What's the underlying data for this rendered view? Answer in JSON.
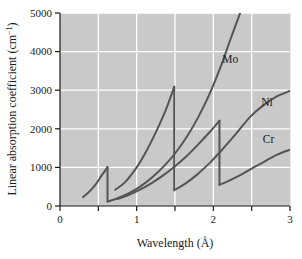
{
  "chart_data": {
    "type": "line",
    "title": "",
    "xlabel": "Wavelength (Å)",
    "ylabel": "Linear absorption coefficient (cm⁻¹)",
    "ylabel_main": "Linear absorption coefficient (cm",
    "ylabel_sup": "−1",
    "ylabel_tail": ")",
    "xlabel_main": "Wavelength (",
    "xlabel_unit": "Å",
    "xlabel_tail": ")",
    "xlim": [
      0,
      3
    ],
    "ylim": [
      0,
      5000
    ],
    "xticks": [
      0,
      1,
      2,
      3
    ],
    "xtick_labels": [
      "0",
      "1",
      "2",
      "3"
    ],
    "xminor_gridlines": [
      0.5,
      1.5,
      2.5
    ],
    "yticks": [
      0,
      1000,
      2000,
      3000,
      4000,
      5000
    ],
    "ytick_labels": [
      "0",
      "1000",
      "2000",
      "3000",
      "4000",
      "5000"
    ],
    "grid": true,
    "grid_color": "#ffffff",
    "plot_bg_color": "#c9c9c9",
    "line_color": "#555555",
    "legend_position": "inline-annotations",
    "series": [
      {
        "name": "Mo",
        "label": "Mo",
        "absorption_edge": 0.62,
        "segments": [
          {
            "x": [
              0.3,
              0.36,
              0.42,
              0.48,
              0.54,
              0.58,
              0.62
            ],
            "y": [
              230,
              330,
              450,
              600,
              780,
              890,
              1010
            ]
          },
          {
            "x": [
              0.62,
              0.75,
              0.9,
              1.05,
              1.2,
              1.35,
              1.5,
              1.65,
              1.8,
              1.95,
              2.1,
              2.22,
              2.35
            ],
            "y": [
              115,
              200,
              330,
              510,
              740,
              1020,
              1360,
              1780,
              2290,
              2900,
              3630,
              4300,
              5000
            ]
          }
        ]
      },
      {
        "name": "Ni",
        "label": "Ni",
        "absorption_edge": 1.49,
        "segments": [
          {
            "x": [
              0.72,
              0.85,
              1.0,
              1.12,
              1.24,
              1.34,
              1.42,
              1.49
            ],
            "y": [
              420,
              620,
              1000,
              1400,
              1870,
              2300,
              2700,
              3090
            ]
          },
          {
            "x": [
              1.49,
              1.62,
              1.78,
              1.95,
              2.12,
              2.3,
              2.48,
              2.66,
              2.84,
              3.0
            ],
            "y": [
              410,
              560,
              800,
              1110,
              1470,
              1880,
              2310,
              2620,
              2850,
              2980
            ]
          }
        ]
      },
      {
        "name": "Cr",
        "label": "Cr",
        "absorption_edge": 2.08,
        "segments": [
          {
            "x": [
              0.75,
              0.9,
              1.05,
              1.2,
              1.35,
              1.5,
              1.65,
              1.8,
              1.95,
              2.08
            ],
            "y": [
              180,
              290,
              430,
              600,
              800,
              1030,
              1290,
              1590,
              1910,
              2210
            ]
          },
          {
            "x": [
              2.08,
              2.2,
              2.35,
              2.5,
              2.65,
              2.8,
              3.0
            ],
            "y": [
              550,
              650,
              800,
              970,
              1130,
              1300,
              1460
            ]
          }
        ]
      }
    ],
    "annotations": [
      {
        "text": "Mo",
        "x": 2.22,
        "y": 3700
      },
      {
        "text": "Ni",
        "x": 2.7,
        "y": 2600
      },
      {
        "text": "Cr",
        "x": 2.72,
        "y": 1620
      }
    ]
  }
}
